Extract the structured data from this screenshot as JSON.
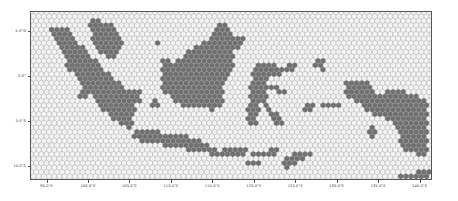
{
  "figure": {
    "title": "",
    "background_color": "#ffffff",
    "frame_color": "#555555",
    "tick_text_color": "#3a3a3a"
  },
  "chart_data": {
    "type": "heatmap",
    "title": "",
    "subtitle": "",
    "xlabel": "",
    "ylabel": "",
    "grid": false,
    "legend": false,
    "legend_position": "none",
    "xlim": [
      93.0,
      141.5
    ],
    "ylim": [
      -11.5,
      7.2
    ],
    "xtick_labels": [
      "95.0°E",
      "100.0°E",
      "105.0°E",
      "110.0°E",
      "115.0°E",
      "120.0°E",
      "125.0°E",
      "130.0°E",
      "135.0°E",
      "140.0°E"
    ],
    "xtick_values": [
      95.0,
      100.0,
      105.0,
      110.0,
      115.0,
      120.0,
      125.0,
      130.0,
      135.0,
      140.0
    ],
    "ytick_labels": [
      "5.0°N",
      "0.0°",
      "5.0°S",
      "10.0°S"
    ],
    "ytick_values": [
      5.0,
      0.0,
      -5.0,
      -10.0
    ],
    "marker": "hexagon",
    "hex_radius_px": 3.0,
    "hex_fill_land": "#6f6f6f",
    "hex_fill_sea": "#f2f2f2",
    "hex_edge_color": "#9a9a9a",
    "regions": [
      {
        "name": "Sumatra",
        "fill": "#6f6f6f"
      },
      {
        "name": "Java",
        "fill": "#6f6f6f"
      },
      {
        "name": "Kalimantan",
        "fill": "#6f6f6f"
      },
      {
        "name": "Sulawesi",
        "fill": "#6f6f6f"
      },
      {
        "name": "Maluku",
        "fill": "#6f6f6f"
      },
      {
        "name": "Papua",
        "fill": "#6f6f6f"
      },
      {
        "name": "Nusa Tenggara",
        "fill": "#6f6f6f"
      }
    ]
  }
}
